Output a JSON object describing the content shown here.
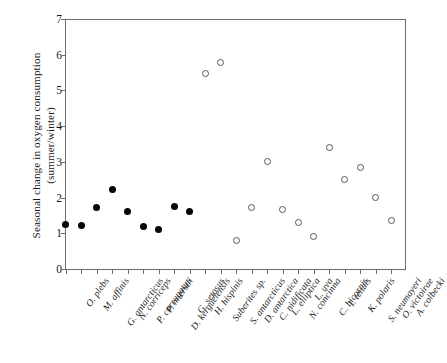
{
  "chart_data": {
    "type": "scatter",
    "title": "",
    "xlabel": "",
    "ylabel": "Seasonal change in oxygen consumption\n(summer/winter)",
    "ylim": [
      0,
      7
    ],
    "ytick_labels": [
      "0",
      "1",
      "2",
      "3",
      "4",
      "5",
      "6",
      "7"
    ],
    "ytick_values": [
      0,
      1,
      2,
      3,
      4,
      5,
      6,
      7
    ],
    "grid": false,
    "legend_position": "none",
    "categories": [
      "O. plebs",
      "M. affinis",
      "G. antarcticus",
      "N. corriceps",
      "P. corrugatus",
      "P. mierstii",
      "D. kerguelensis",
      "G. setosus",
      "H. hispinis",
      "Suberites sp.",
      "S. antarcticus",
      "D. antarctica",
      "C. nidificata",
      "L. elliptica",
      "N. concinna",
      "L. uva",
      "C. bicornis",
      "I. tenuis",
      "K. polaris",
      "S. neumayeri",
      "O. victoirae",
      "A. colbecki"
    ],
    "series": [
      {
        "name": "filled",
        "marker": "filled-circle",
        "color": "#050505",
        "points": [
          {
            "category": "O. plebs",
            "x": 0,
            "y": 1.25
          },
          {
            "category": "M. affinis",
            "x": 1,
            "y": 1.22
          },
          {
            "category": "G. antarcticus",
            "x": 2,
            "y": 1.72
          },
          {
            "category": "N. corriceps",
            "x": 3,
            "y": 2.22
          },
          {
            "category": "P. corrugatus",
            "x": 4,
            "y": 1.62
          },
          {
            "category": "P. mierstii",
            "x": 5,
            "y": 1.2
          },
          {
            "category": "D. kerguelensis",
            "x": 6,
            "y": 1.1
          },
          {
            "category": "G. setosus",
            "x": 7,
            "y": 1.75
          },
          {
            "category": "H. hispinis",
            "x": 8,
            "y": 1.6
          }
        ]
      },
      {
        "name": "open",
        "marker": "open-circle",
        "color": "#55555c",
        "points": [
          {
            "category": "Suberites sp.",
            "x": 9,
            "y": 5.48
          },
          {
            "category": "S. antarcticus",
            "x": 10,
            "y": 5.78
          },
          {
            "category": "D. antarctica",
            "x": 11,
            "y": 0.8
          },
          {
            "category": "C. nidificata",
            "x": 12,
            "y": 1.72
          },
          {
            "category": "L. elliptica",
            "x": 13,
            "y": 3.0
          },
          {
            "category": "N. concinna",
            "x": 14,
            "y": 1.68
          },
          {
            "category": "L. uva",
            "x": 15,
            "y": 1.3
          },
          {
            "category": "C. bicornis",
            "x": 16,
            "y": 0.92
          },
          {
            "category": "I. tenuis",
            "x": 17,
            "y": 3.4
          },
          {
            "category": "K. polaris",
            "x": 18,
            "y": 2.5
          },
          {
            "category": "S. neumayeri",
            "x": 19,
            "y": 2.85
          },
          {
            "category": "O. victoirae",
            "x": 20,
            "y": 2.0
          },
          {
            "category": "A. colbecki",
            "x": 21,
            "y": 1.37
          }
        ]
      }
    ]
  }
}
